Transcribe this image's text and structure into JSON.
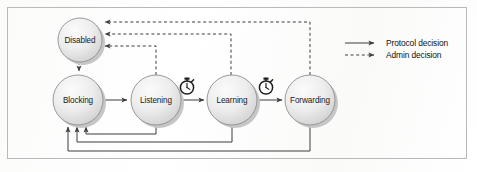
{
  "diagram": {
    "colors": {
      "node_fill_light": "#f2f2f2",
      "node_fill_dark": "#d4d4d4",
      "node_stroke": "#8f8f8f",
      "node_shadow": "#bfbfbf",
      "line": "#4a4a4a",
      "frame": "#b9b9b9",
      "page_background": "#fdfdfd",
      "text": "#1a1a1a"
    },
    "nodes": [
      {
        "id": "disabled",
        "label": "Disabled",
        "cx": 80,
        "cy": 40,
        "r": 22
      },
      {
        "id": "blocking",
        "label": "Blocking",
        "cx": 78,
        "cy": 100,
        "r": 25
      },
      {
        "id": "listening",
        "label": "Listening",
        "cx": 156,
        "cy": 100,
        "r": 25
      },
      {
        "id": "learning",
        "label": "Learning",
        "cx": 232,
        "cy": 100,
        "r": 25
      },
      {
        "id": "forwarding",
        "label": "Forwarding",
        "cx": 310,
        "cy": 100,
        "r": 25
      }
    ],
    "timers": [
      {
        "id": "timer-listening-to-learning",
        "cx": 187,
        "cy": 86,
        "label": "stopwatch-icon"
      },
      {
        "id": "timer-learning-to-forwarding",
        "cx": 266,
        "cy": 86,
        "label": "stopwatch-icon"
      }
    ],
    "edges": [
      {
        "id": "disabled-to-blocking",
        "from": "disabled",
        "to": "blocking",
        "kind": "admin"
      },
      {
        "id": "blocking-to-listening",
        "from": "blocking",
        "to": "listening",
        "kind": "protocol"
      },
      {
        "id": "listening-to-learning",
        "from": "listening",
        "to": "learning",
        "kind": "protocol"
      },
      {
        "id": "learning-to-forwarding",
        "from": "learning",
        "to": "forwarding",
        "kind": "protocol"
      },
      {
        "id": "listening-to-blocking",
        "from": "listening",
        "to": "blocking",
        "kind": "protocol"
      },
      {
        "id": "learning-to-blocking",
        "from": "learning",
        "to": "blocking",
        "kind": "protocol"
      },
      {
        "id": "forwarding-to-blocking",
        "from": "forwarding",
        "to": "blocking",
        "kind": "protocol"
      },
      {
        "id": "listening-to-disabled",
        "from": "listening",
        "to": "disabled",
        "kind": "admin"
      },
      {
        "id": "learning-to-disabled",
        "from": "learning",
        "to": "disabled",
        "kind": "admin"
      },
      {
        "id": "forwarding-to-disabled",
        "from": "forwarding",
        "to": "disabled",
        "kind": "admin"
      }
    ],
    "legend": {
      "items": [
        {
          "id": "legend-protocol",
          "label": "Protocol decision",
          "style": "solid"
        },
        {
          "id": "legend-admin",
          "label": "Admin decision",
          "style": "dashed"
        }
      ]
    }
  }
}
